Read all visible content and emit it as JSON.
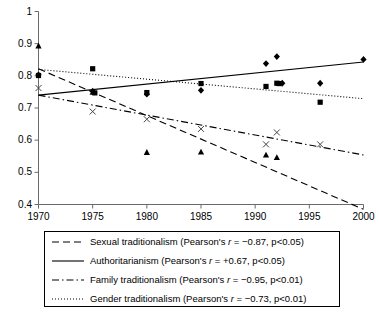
{
  "chart_data": {
    "type": "scatter",
    "title": "",
    "xlabel": "",
    "ylabel": "",
    "xlim": [
      1970,
      2000
    ],
    "ylim": [
      0.4,
      1.0
    ],
    "xticks": [
      1970,
      1975,
      1980,
      1985,
      1990,
      1995,
      2000
    ],
    "yticks": [
      0.4,
      0.5,
      0.6,
      0.7,
      0.8,
      0.9,
      1
    ],
    "ytick_labels": [
      "0.4",
      "0.5",
      "0.6",
      "0.7",
      "0.8",
      "0.9",
      "1"
    ],
    "xtick_labels": [
      "1970",
      "1975",
      "1980",
      "1985",
      "1990",
      "1995",
      "2000"
    ],
    "grid": false,
    "legend_position": "below-plot",
    "series": [
      {
        "name": "Sexual traditionalism",
        "marker": "triangle",
        "line_style": "dashed",
        "pearson_r": "-0.87",
        "p_value": "p<0.05",
        "points": [
          {
            "x": 1970,
            "y": 0.893
          },
          {
            "x": 1975,
            "y": 0.749
          },
          {
            "x": 1980,
            "y": 0.562
          },
          {
            "x": 1985,
            "y": 0.563
          },
          {
            "x": 1991,
            "y": 0.554
          },
          {
            "x": 1992,
            "y": 0.546
          }
        ],
        "trend": [
          {
            "x": 1970,
            "y": 0.822
          },
          {
            "x": 2000,
            "y": 0.385
          }
        ]
      },
      {
        "name": "Authoritarianism",
        "marker": "diamond",
        "line_style": "solid",
        "pearson_r": "+0.67",
        "p_value": "p<0.05",
        "points": [
          {
            "x": 1970,
            "y": 0.803
          },
          {
            "x": 1975,
            "y": 0.752
          },
          {
            "x": 1980,
            "y": 0.743
          },
          {
            "x": 1985,
            "y": 0.755
          },
          {
            "x": 1991,
            "y": 0.838
          },
          {
            "x": 1992,
            "y": 0.86
          },
          {
            "x": 1992.5,
            "y": 0.777
          },
          {
            "x": 1996,
            "y": 0.777
          },
          {
            "x": 2000,
            "y": 0.851
          }
        ],
        "trend": [
          {
            "x": 1970,
            "y": 0.74
          },
          {
            "x": 2000,
            "y": 0.843
          }
        ]
      },
      {
        "name": "Family traditionalism",
        "marker": "cross",
        "line_style": "dash-dot",
        "pearson_r": "-0.95",
        "p_value": "p<0.01",
        "points": [
          {
            "x": 1970,
            "y": 0.762
          },
          {
            "x": 1975,
            "y": 0.689
          },
          {
            "x": 1980,
            "y": 0.665
          },
          {
            "x": 1985,
            "y": 0.635
          },
          {
            "x": 1991,
            "y": 0.587
          },
          {
            "x": 1992,
            "y": 0.624
          },
          {
            "x": 1996,
            "y": 0.587
          }
        ],
        "trend": [
          {
            "x": 1970,
            "y": 0.74
          },
          {
            "x": 2000,
            "y": 0.554
          }
        ]
      },
      {
        "name": "Gender traditionalism",
        "marker": "square",
        "line_style": "dotted",
        "pearson_r": "-0.73",
        "p_value": "p<0.01",
        "points": [
          {
            "x": 1970,
            "y": 0.801
          },
          {
            "x": 1975,
            "y": 0.822
          },
          {
            "x": 1975.2,
            "y": 0.747
          },
          {
            "x": 1980,
            "y": 0.748
          },
          {
            "x": 1985,
            "y": 0.776
          },
          {
            "x": 1991,
            "y": 0.767
          },
          {
            "x": 1992,
            "y": 0.777
          },
          {
            "x": 1992.2,
            "y": 0.776
          },
          {
            "x": 1996,
            "y": 0.718
          }
        ],
        "trend": [
          {
            "x": 1970,
            "y": 0.82
          },
          {
            "x": 2000,
            "y": 0.729
          }
        ]
      }
    ]
  },
  "legend": {
    "rows": [
      {
        "label": "Sexual traditionalism (Pearson's ",
        "r_sym": "r",
        "stats": " = −0.87, p<0.05)",
        "style": "dashed"
      },
      {
        "label": "Authoritarianism (Pearson's ",
        "r_sym": "r",
        "stats": " = +0.67, p<0.05)",
        "style": "solid"
      },
      {
        "label": "Family traditionalism (Pearson's ",
        "r_sym": "r",
        "stats": " = −0.95, p<0.01)",
        "style": "dash-dot"
      },
      {
        "label": "Gender traditionalism (Pearson's ",
        "r_sym": "r",
        "stats": " = −0.73, p<0.01)",
        "style": "dotted"
      }
    ]
  },
  "colors": {
    "axis": "#6b6b6b",
    "ink": "#000000",
    "background": "#ffffff"
  }
}
